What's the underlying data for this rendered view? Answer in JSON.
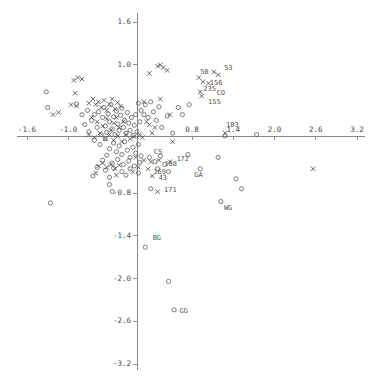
{
  "chart_data": {
    "type": "scatter",
    "title": "",
    "subtitle": "",
    "xlabel": "",
    "ylabel": "",
    "xlim": [
      -1.9,
      3.35
    ],
    "ylim": [
      -3.3,
      1.75
    ],
    "grid": false,
    "legend": "none",
    "axis_style": "crosshair-at-origin",
    "xticks": [
      -1.6,
      -1.0,
      0.8,
      1.4,
      2.0,
      2.6,
      3.2
    ],
    "xticklabels": [
      "-1.6",
      "-1.0",
      "0.8",
      "1.4",
      "2.0",
      "2.6",
      "3.2"
    ],
    "yticks": [
      1.6,
      1.0,
      -0.8,
      -1.4,
      -2.0,
      -2.6,
      -3.2
    ],
    "yticklabels": [
      "1.6",
      "1.0",
      "-0.8",
      "-1.4",
      "-2.0",
      "-2.6",
      "-3.2"
    ],
    "tick_interval_x": 0.6,
    "tick_interval_y": 0.6,
    "marker_colors": {
      "circle": "#555555",
      "cross": "#444444"
    },
    "series": [
      {
        "name": "circles",
        "marker": "circle",
        "points": [
          [
            -1.32,
            0.62
          ],
          [
            -1.3,
            0.4
          ],
          [
            -0.88,
            0.45
          ],
          [
            -0.8,
            0.3
          ],
          [
            -0.72,
            0.36
          ],
          [
            -0.76,
            0.16
          ],
          [
            -0.7,
            0.06
          ],
          [
            -0.66,
            0.22
          ],
          [
            -0.62,
            0.3
          ],
          [
            -0.58,
            0.12
          ],
          [
            -0.56,
            0.34
          ],
          [
            -0.52,
            0.02
          ],
          [
            -0.5,
            0.26
          ],
          [
            -0.48,
            0.4
          ],
          [
            -0.46,
            0.14
          ],
          [
            -0.44,
            0.05
          ],
          [
            -0.42,
            0.31
          ],
          [
            -0.4,
            0.2
          ],
          [
            -0.38,
            0.44
          ],
          [
            -0.36,
            0.1
          ],
          [
            -0.34,
            0.27
          ],
          [
            -0.32,
            0.02
          ],
          [
            -0.3,
            0.35
          ],
          [
            -0.28,
            0.17
          ],
          [
            -0.26,
            0.08
          ],
          [
            -0.24,
            0.29
          ],
          [
            -0.22,
            0.39
          ],
          [
            -0.2,
            0.12
          ],
          [
            -0.18,
            0.22
          ],
          [
            -0.16,
            0.04
          ],
          [
            -0.14,
            0.33
          ],
          [
            -0.12,
            0.18
          ],
          [
            -0.1,
            0.08
          ],
          [
            -0.08,
            0.26
          ],
          [
            -0.06,
            0.01
          ],
          [
            -0.04,
            0.15
          ],
          [
            -0.02,
            0.3
          ],
          [
            0.0,
            0.06
          ],
          [
            0.02,
            0.46
          ],
          [
            0.04,
            0.2
          ],
          [
            0.06,
            0.36
          ],
          [
            0.1,
            0.3
          ],
          [
            0.12,
            0.44
          ],
          [
            0.16,
            0.26
          ],
          [
            0.2,
            0.48
          ],
          [
            0.24,
            0.34
          ],
          [
            0.28,
            0.22
          ],
          [
            0.32,
            0.41
          ],
          [
            -0.62,
            -0.06
          ],
          [
            -0.54,
            -0.12
          ],
          [
            -0.46,
            -0.04
          ],
          [
            -0.4,
            -0.18
          ],
          [
            -0.34,
            -0.1
          ],
          [
            -0.3,
            -0.22
          ],
          [
            -0.26,
            -0.14
          ],
          [
            -0.22,
            -0.26
          ],
          [
            -0.18,
            -0.08
          ],
          [
            -0.14,
            -0.2
          ],
          [
            -0.1,
            -0.3
          ],
          [
            -0.06,
            -0.16
          ],
          [
            -0.02,
            -0.24
          ],
          [
            0.02,
            -0.12
          ],
          [
            0.06,
            -0.28
          ],
          [
            -0.5,
            -0.34
          ],
          [
            -0.44,
            -0.27
          ],
          [
            -0.36,
            -0.38
          ],
          [
            -0.28,
            -0.33
          ],
          [
            -0.2,
            -0.4
          ],
          [
            -0.12,
            -0.35
          ],
          [
            -0.04,
            -0.42
          ],
          [
            0.04,
            -0.37
          ],
          [
            -0.58,
            -0.44
          ],
          [
            -0.46,
            -0.48
          ],
          [
            -0.34,
            -0.45
          ],
          [
            -0.22,
            -0.5
          ],
          [
            -0.1,
            -0.46
          ],
          [
            0.02,
            -0.52
          ],
          [
            -0.64,
            -0.56
          ],
          [
            -0.4,
            -0.58
          ],
          [
            -0.16,
            -0.55
          ],
          [
            0.18,
            -0.3
          ],
          [
            0.26,
            -0.36
          ],
          [
            0.34,
            -0.28
          ],
          [
            0.3,
            -0.46
          ],
          [
            0.4,
            -0.4
          ],
          [
            0.46,
            -0.5
          ],
          [
            0.74,
            -0.26
          ],
          [
            0.92,
            -0.46
          ],
          [
            1.18,
            -0.3
          ],
          [
            1.44,
            -0.6
          ],
          [
            1.52,
            -0.74
          ],
          [
            1.22,
            -0.92
          ],
          [
            -0.4,
            -0.68
          ],
          [
            -0.36,
            -0.78
          ],
          [
            -1.26,
            -0.94
          ],
          [
            0.2,
            -0.74
          ],
          [
            0.12,
            -1.56
          ],
          [
            0.46,
            -2.04
          ],
          [
            0.54,
            -2.44
          ],
          [
            0.6,
            0.4
          ],
          [
            0.36,
            0.12
          ],
          [
            0.52,
            0.04
          ],
          [
            0.66,
            0.3
          ],
          [
            0.76,
            0.44
          ],
          [
            1.74,
            0.02
          ],
          [
            1.28,
            0.0
          ],
          [
            0.44,
            0.28
          ]
        ]
      },
      {
        "name": "crosses",
        "marker": "cross",
        "points": [
          [
            -1.22,
            0.3
          ],
          [
            -1.14,
            0.33
          ],
          [
            -0.92,
            0.78
          ],
          [
            -0.86,
            0.82
          ],
          [
            -0.8,
            0.8
          ],
          [
            -0.9,
            0.6
          ],
          [
            -0.96,
            0.44
          ],
          [
            -0.88,
            0.42
          ],
          [
            -0.7,
            0.46
          ],
          [
            -0.64,
            0.52
          ],
          [
            -0.6,
            0.44
          ],
          [
            -0.56,
            0.48
          ],
          [
            -0.52,
            0.4
          ],
          [
            -0.48,
            0.5
          ],
          [
            -0.44,
            0.36
          ],
          [
            -0.4,
            0.45
          ],
          [
            -0.36,
            0.52
          ],
          [
            -0.32,
            0.38
          ],
          [
            -0.28,
            0.47
          ],
          [
            -0.24,
            0.42
          ],
          [
            -0.66,
            0.26
          ],
          [
            -0.58,
            0.2
          ],
          [
            -0.5,
            0.14
          ],
          [
            -0.44,
            0.24
          ],
          [
            -0.38,
            0.08
          ],
          [
            -0.34,
            0.18
          ],
          [
            -0.3,
            0.26
          ],
          [
            -0.26,
            0.12
          ],
          [
            -0.2,
            0.2
          ],
          [
            -0.7,
            0.02
          ],
          [
            -0.62,
            -0.02
          ],
          [
            -0.54,
            0.04
          ],
          [
            -0.46,
            -0.04
          ],
          [
            -0.4,
            0.02
          ],
          [
            -0.34,
            -0.06
          ],
          [
            -0.28,
            0.0
          ],
          [
            -0.22,
            -0.08
          ],
          [
            -0.16,
            0.02
          ],
          [
            -0.1,
            -0.04
          ],
          [
            -0.04,
            -0.01
          ],
          [
            -0.56,
            -0.42
          ],
          [
            -0.5,
            -0.38
          ],
          [
            -0.44,
            -0.44
          ],
          [
            -0.38,
            -0.4
          ],
          [
            -0.32,
            -0.46
          ],
          [
            -0.26,
            -0.41
          ],
          [
            -0.6,
            -0.52
          ],
          [
            -0.3,
            -0.55
          ],
          [
            0.04,
            0.02
          ],
          [
            0.08,
            -0.02
          ],
          [
            0.14,
            0.2
          ],
          [
            0.18,
            0.16
          ],
          [
            0.22,
            0.04
          ],
          [
            0.26,
            0.12
          ],
          [
            0.1,
            0.48
          ],
          [
            0.34,
            0.52
          ],
          [
            0.18,
            0.88
          ],
          [
            0.3,
            0.98
          ],
          [
            0.34,
            1.0
          ],
          [
            0.38,
            0.96
          ],
          [
            0.44,
            0.92
          ],
          [
            0.48,
            0.3
          ],
          [
            0.52,
            -0.08
          ],
          [
            0.9,
            0.82
          ],
          [
            0.96,
            0.76
          ],
          [
            1.04,
            0.74
          ],
          [
            1.18,
            0.86
          ],
          [
            1.12,
            0.9
          ],
          [
            0.92,
            0.62
          ],
          [
            0.94,
            0.56
          ],
          [
            1.28,
            0.04
          ],
          [
            0.1,
            -0.34
          ],
          [
            0.2,
            -0.36
          ],
          [
            0.32,
            -0.34
          ],
          [
            0.48,
            -0.36
          ],
          [
            0.16,
            -0.46
          ],
          [
            0.22,
            -0.56
          ],
          [
            0.3,
            -0.78
          ],
          [
            2.56,
            -0.46
          ],
          [
            -0.02,
            -0.3
          ],
          [
            0.02,
            -0.44
          ],
          [
            -0.06,
            -0.5
          ]
        ]
      }
    ],
    "annotations": [
      {
        "text": "50",
        "x": 0.86,
        "y": 0.84,
        "dx": 4,
        "dy": -4
      },
      {
        "text": "156",
        "x": 1.0,
        "y": 0.76,
        "dx": 4,
        "dy": 1
      },
      {
        "text": "53",
        "x": 1.18,
        "y": 0.88,
        "dx": 6,
        "dy": -5
      },
      {
        "text": "235",
        "x": 0.92,
        "y": 0.62,
        "dx": 3,
        "dy": -3
      },
      {
        "text": "CO",
        "x": 1.1,
        "y": 0.6,
        "dx": 4,
        "dy": 0
      },
      {
        "text": "155",
        "x": 0.96,
        "y": 0.52,
        "dx": 5,
        "dy": 3
      },
      {
        "text": "103",
        "x": 1.28,
        "y": 0.08,
        "dx": 1,
        "dy": -5
      },
      {
        "text": "CS",
        "x": 0.2,
        "y": -0.28,
        "dx": 3,
        "dy": -4
      },
      {
        "text": "168",
        "x": 0.34,
        "y": -0.36,
        "dx": 4,
        "dy": 2
      },
      {
        "text": "172",
        "x": 0.5,
        "y": -0.34,
        "dx": 5,
        "dy": -1
      },
      {
        "text": "169",
        "x": 0.18,
        "y": -0.47,
        "dx": 4,
        "dy": 3
      },
      {
        "text": "GA",
        "x": 0.76,
        "y": -0.5,
        "dx": 5,
        "dy": 3
      },
      {
        "text": "43",
        "x": 0.24,
        "y": -0.58,
        "dx": 5,
        "dy": 1
      },
      {
        "text": "171",
        "x": 0.32,
        "y": -0.8,
        "dx": 5,
        "dy": -3
      },
      {
        "text": "WG",
        "x": 1.22,
        "y": -0.95,
        "dx": 3,
        "dy": 4
      },
      {
        "text": "BG",
        "x": 0.14,
        "y": -1.5,
        "dx": 6,
        "dy": -5
      },
      {
        "text": "GG",
        "x": 0.56,
        "y": -2.44,
        "dx": 4,
        "dy": 1
      }
    ]
  }
}
